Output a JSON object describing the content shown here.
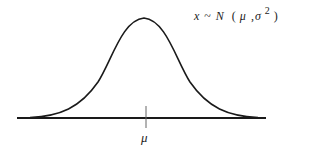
{
  "formula": {
    "variable": "x",
    "tilde": "~",
    "distribution": "N",
    "open_paren": "(",
    "mean": "μ",
    "comma": ",",
    "variance_symbol": "σ",
    "exponent": "2",
    "close_paren": ")"
  },
  "axis": {
    "tick_label": "μ"
  },
  "colors": {
    "curve": "#1a1a1a",
    "baseline": "#1a1a1a",
    "tick": "#555555",
    "background": "#ffffff"
  },
  "curve": {
    "type": "normal-distribution",
    "baseline_y": 118,
    "peak_x": 144,
    "peak_y": 18,
    "x_start": 17,
    "x_end": 266
  }
}
